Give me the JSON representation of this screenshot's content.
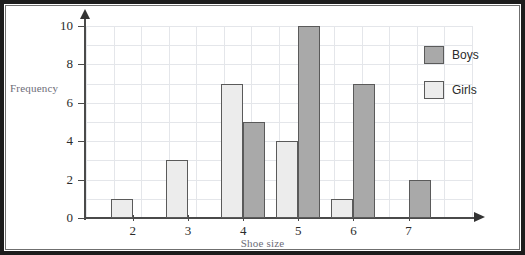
{
  "chart_data": {
    "type": "bar",
    "title": "",
    "xlabel": "Shoe size",
    "ylabel": "Frequency",
    "categories": [
      "2",
      "3",
      "4",
      "5",
      "6",
      "7"
    ],
    "series": [
      {
        "name": "Girls",
        "color": "#ececec",
        "values": [
          1,
          3,
          7,
          4,
          1,
          0
        ]
      },
      {
        "name": "Boys",
        "color": "#a9a9a9",
        "values": [
          0,
          0,
          5,
          10,
          7,
          2
        ]
      }
    ],
    "ylim": [
      0,
      10
    ],
    "ytick_labels": [
      "0",
      "2",
      "4",
      "6",
      "8",
      "10"
    ],
    "ytick_values": [
      0,
      2,
      4,
      6,
      8,
      10
    ],
    "grid": true,
    "grid_major_y_step": 1,
    "legend_position": "right",
    "axis_arrows": true
  },
  "legend": {
    "items": [
      {
        "label": "Boys",
        "swatch": "boys-swatch"
      },
      {
        "label": "Girls",
        "swatch": "girls-swatch"
      }
    ]
  },
  "axes": {
    "y_title": "Frequency",
    "x_title": "Shoe size"
  }
}
